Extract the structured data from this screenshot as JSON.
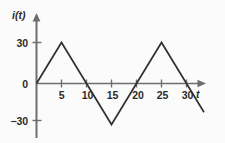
{
  "chart_data": {
    "type": "line",
    "title": "",
    "subtitle": "",
    "xlabel": "t",
    "ylabel": "i(t)",
    "grid": false,
    "legend": false,
    "legend_position": "none",
    "xlim": [
      0,
      33.5
    ],
    "ylim": [
      -30,
      30
    ],
    "xticks": [
      5,
      10,
      15,
      20,
      25,
      30
    ],
    "xtick_labels": [
      "5",
      "10",
      "15",
      "20",
      "25",
      "30"
    ],
    "yticks": [
      30,
      0,
      -30
    ],
    "ytick_labels": [
      "30",
      "0",
      "−30"
    ],
    "series": [
      {
        "name": "i(t)",
        "color": "#33312f",
        "x": [
          0,
          5,
          10,
          15,
          20,
          25,
          30,
          33.5
        ],
        "y": [
          0,
          30,
          0,
          -30,
          0,
          30,
          0,
          -21
        ]
      }
    ],
    "annotations": []
  },
  "axes": {
    "y_axis_name": "i(t)",
    "x_axis_name": "t",
    "axis_color": "#6e6e72",
    "text_color": "#2b2b2b",
    "background_color": "#fbfbfb"
  }
}
